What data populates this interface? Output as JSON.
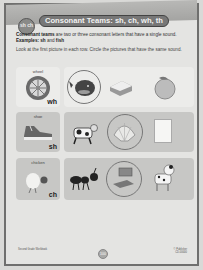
{
  "header": {
    "badge": "sh ch",
    "title": "Consonant Teams: sh, ch, wh, th"
  },
  "intro": {
    "term": "Consonant teams",
    "definition": " are two or three consonant letters that have a single sound. ",
    "examples_label": "Examples:",
    "example1": " sh",
    "and": " and",
    "example2": " fish"
  },
  "instructions": "Look at the first picture in each row. Circle the pictures that have the same sound.",
  "rows": [
    {
      "keyword": "wheel",
      "digraph": "wh",
      "choices": [
        "whale",
        "sandwich",
        "peach"
      ],
      "circled": [
        0
      ]
    },
    {
      "keyword": "shoe",
      "digraph": "sh",
      "choices": [
        "cow",
        "shell",
        "paper"
      ],
      "circled": [
        1
      ]
    },
    {
      "keyword": "chicken",
      "digraph": "ch",
      "choices": [
        "ant",
        "laptop",
        "dog"
      ],
      "circled": [
        1
      ]
    }
  ],
  "footer": {
    "left": "Second Grade Workbook",
    "right_line1": "© Publisher",
    "right_line2": "CD-00000",
    "page_number": "100"
  }
}
